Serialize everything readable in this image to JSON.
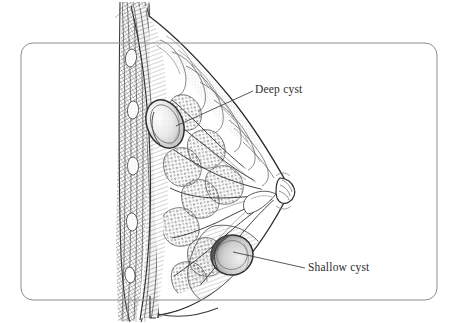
{
  "figure": {
    "kind": "anatomical-illustration",
    "style": "pen-and-ink stipple and hatch, grayscale",
    "background_color": "#ffffff",
    "ink_color": "#3a3a3a",
    "frame": {
      "shape": "rounded-rectangle",
      "x": 21,
      "y": 43,
      "width": 416,
      "height": 257,
      "corner_radius": 12,
      "stroke_color": "#8d8d8d",
      "stroke_width": 1
    },
    "labels": [
      {
        "id": "deep-cyst",
        "text": "Deep cyst",
        "text_color": "#2e2c2c",
        "text_x": 255,
        "text_y": 84,
        "leader_from_x": 253,
        "leader_from_y": 91,
        "leader_to_x": 176,
        "leader_to_y": 126
      },
      {
        "id": "shallow-cyst",
        "text": "Shallow cyst",
        "text_color": "#2e2c2c",
        "text_x": 308,
        "text_y": 262,
        "leader_from_x": 305,
        "leader_from_y": 268,
        "leader_to_x": 233,
        "leader_to_y": 252
      }
    ],
    "structures": [
      {
        "id": "chest-wall",
        "label": "chest wall / rib and muscle layers",
        "region": "left vertical band"
      },
      {
        "id": "pectoral-muscle",
        "label": "pectoral muscle hatching",
        "region": "left of breast tissue"
      },
      {
        "id": "glandular-tissue",
        "label": "glandular lobules and ducts",
        "region": "center of breast"
      },
      {
        "id": "nipple",
        "label": "nipple",
        "x": 288,
        "y": 192
      },
      {
        "id": "deep-cyst-mass",
        "label": "deep cyst",
        "cx": 165,
        "cy": 124,
        "rx": 18,
        "ry": 25
      },
      {
        "id": "shallow-cyst-mass",
        "label": "shallow cyst",
        "cx": 232,
        "cy": 255,
        "rx": 21,
        "ry": 20
      }
    ]
  }
}
